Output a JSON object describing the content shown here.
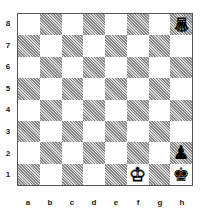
{
  "board": {
    "ranks": [
      "8",
      "7",
      "6",
      "5",
      "4",
      "3",
      "2",
      "1"
    ],
    "files": [
      "a",
      "b",
      "c",
      "d",
      "e",
      "f",
      "g",
      "h"
    ],
    "pieces": {
      "h8": {
        "glyph": "♕",
        "color": "white",
        "name": "queen",
        "inverted": true
      },
      "f1": {
        "glyph": "♔",
        "color": "white",
        "name": "king",
        "inverted": false
      },
      "h2": {
        "glyph": "♟",
        "color": "black",
        "name": "pawn",
        "inverted": false
      },
      "h1": {
        "glyph": "♚",
        "color": "black",
        "name": "king",
        "inverted": false
      }
    }
  }
}
